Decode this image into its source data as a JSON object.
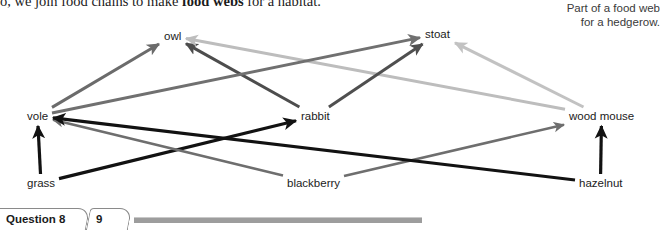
{
  "intro": {
    "prefix": "o, we join food chains to make ",
    "emphasis": "food webs",
    "suffix": " for a habitat."
  },
  "caption": {
    "line1": "Part of a food web",
    "line2": "for a hedgerow."
  },
  "diagram": {
    "title": "Part of a food web for a hedgerow",
    "nodes": [
      {
        "id": "owl",
        "label": "owl",
        "x": 163,
        "y": 30,
        "trophic": "predator"
      },
      {
        "id": "stoat",
        "label": "stoat",
        "x": 424,
        "y": 28,
        "trophic": "predator"
      },
      {
        "id": "vole",
        "label": "vole",
        "x": 26,
        "y": 110,
        "trophic": "primary-consumer"
      },
      {
        "id": "rabbit",
        "label": "rabbit",
        "x": 300,
        "y": 110,
        "trophic": "primary-consumer"
      },
      {
        "id": "wood-mouse",
        "label": "wood mouse",
        "x": 568,
        "y": 110,
        "trophic": "primary-consumer"
      },
      {
        "id": "grass",
        "label": "grass",
        "x": 26,
        "y": 177,
        "trophic": "producer"
      },
      {
        "id": "blackberry",
        "label": "blackberry",
        "x": 286,
        "y": 177,
        "trophic": "producer"
      },
      {
        "id": "hazelnut",
        "label": "hazelnut",
        "x": 578,
        "y": 177,
        "trophic": "producer"
      }
    ],
    "arrows": [
      {
        "from": "vole",
        "to": "owl",
        "color": "#6b6b6b",
        "width": 3.0
      },
      {
        "from": "rabbit",
        "to": "owl",
        "color": "#4d4d4d",
        "width": 3.0
      },
      {
        "from": "wood-mouse",
        "to": "owl",
        "color": "#bdbdbd",
        "width": 3.0
      },
      {
        "from": "vole",
        "to": "stoat",
        "color": "#707070",
        "width": 3.0
      },
      {
        "from": "rabbit",
        "to": "stoat",
        "color": "#4f4f4f",
        "width": 3.0
      },
      {
        "from": "wood-mouse",
        "to": "stoat",
        "color": "#c2c2c2",
        "width": 3.0
      },
      {
        "from": "grass",
        "to": "vole",
        "color": "#121212",
        "width": 3.2
      },
      {
        "from": "grass",
        "to": "rabbit",
        "color": "#121212",
        "width": 3.2
      },
      {
        "from": "blackberry",
        "to": "vole",
        "color": "#6e6e6e",
        "width": 2.6
      },
      {
        "from": "blackberry",
        "to": "wood-mouse",
        "color": "#6e6e6e",
        "width": 2.6
      },
      {
        "from": "hazelnut",
        "to": "wood-mouse",
        "color": "#121212",
        "width": 3.2
      },
      {
        "from": "hazelnut",
        "to": "vole",
        "color": "#121212",
        "width": 3.2
      }
    ]
  },
  "question_bar": {
    "current_tab": "Question 8",
    "next_tab": "9"
  }
}
